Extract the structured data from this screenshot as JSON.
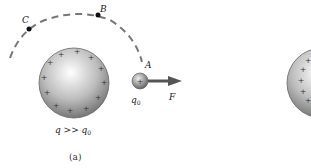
{
  "figure": {
    "panel_label": "(a)",
    "points": [
      {
        "name": "A",
        "x": 142,
        "y": 64
      },
      {
        "name": "B",
        "x": 97,
        "y": 15
      },
      {
        "name": "C",
        "x": 29,
        "y": 29
      }
    ],
    "large_charge": {
      "label": "q >> q",
      "sub": "0",
      "sign": "+"
    },
    "test_charge": {
      "label": "q",
      "sub": "0",
      "sign": "+"
    },
    "force": {
      "label": "F"
    },
    "colors": {
      "sphere_light": "#ffffff",
      "sphere_dark": "#6f6f6f",
      "arrow": "#555555",
      "path": "#777777",
      "point": "#111111"
    }
  }
}
